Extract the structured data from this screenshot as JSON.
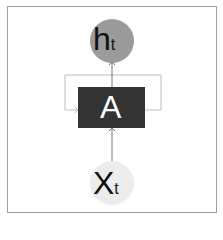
{
  "diagram": {
    "type": "rnn-cell",
    "output_node": {
      "main": "h",
      "sub": "t",
      "fill": "#9b9b9b"
    },
    "cell": {
      "label": "A",
      "fill": "#333333"
    },
    "input_node": {
      "main": "X",
      "sub": "t",
      "fill": "#ececec"
    },
    "colors": {
      "border": "#9a9a9a",
      "line": "#8a8a8a"
    }
  }
}
